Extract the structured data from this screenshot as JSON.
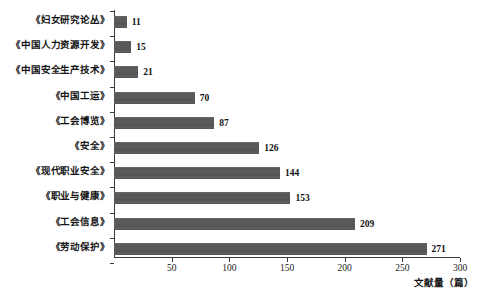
{
  "chart_data": {
    "type": "bar",
    "orientation": "horizontal",
    "title": "",
    "subtitle": "",
    "xlabel": "文献量（篇）",
    "ylabel": "",
    "xlim": [
      0,
      300
    ],
    "xticks": [
      50,
      100,
      150,
      200,
      250,
      300
    ],
    "xtick_labels": [
      "50",
      "100",
      "150",
      "200",
      "250",
      "300"
    ],
    "grid": false,
    "legend": null,
    "bar_color": "#595959",
    "background_color": "#ffffff",
    "axis_color": "#3a3a3a",
    "categories": [
      "《妇女研究论丛》",
      "《中国人力资源开发》",
      "《中国安全生产技术》",
      "《中国工运》",
      "《工会博览》",
      "《安全》",
      "《现代职业安全》",
      "《职业与健康》",
      "《工会信息》",
      "《劳动保护》"
    ],
    "values": [
      11,
      15,
      21,
      70,
      87,
      126,
      144,
      153,
      209,
      271
    ],
    "value_labels": [
      "11",
      "15",
      "21",
      "70",
      "87",
      "126",
      "144",
      "153",
      "209",
      "271"
    ]
  }
}
